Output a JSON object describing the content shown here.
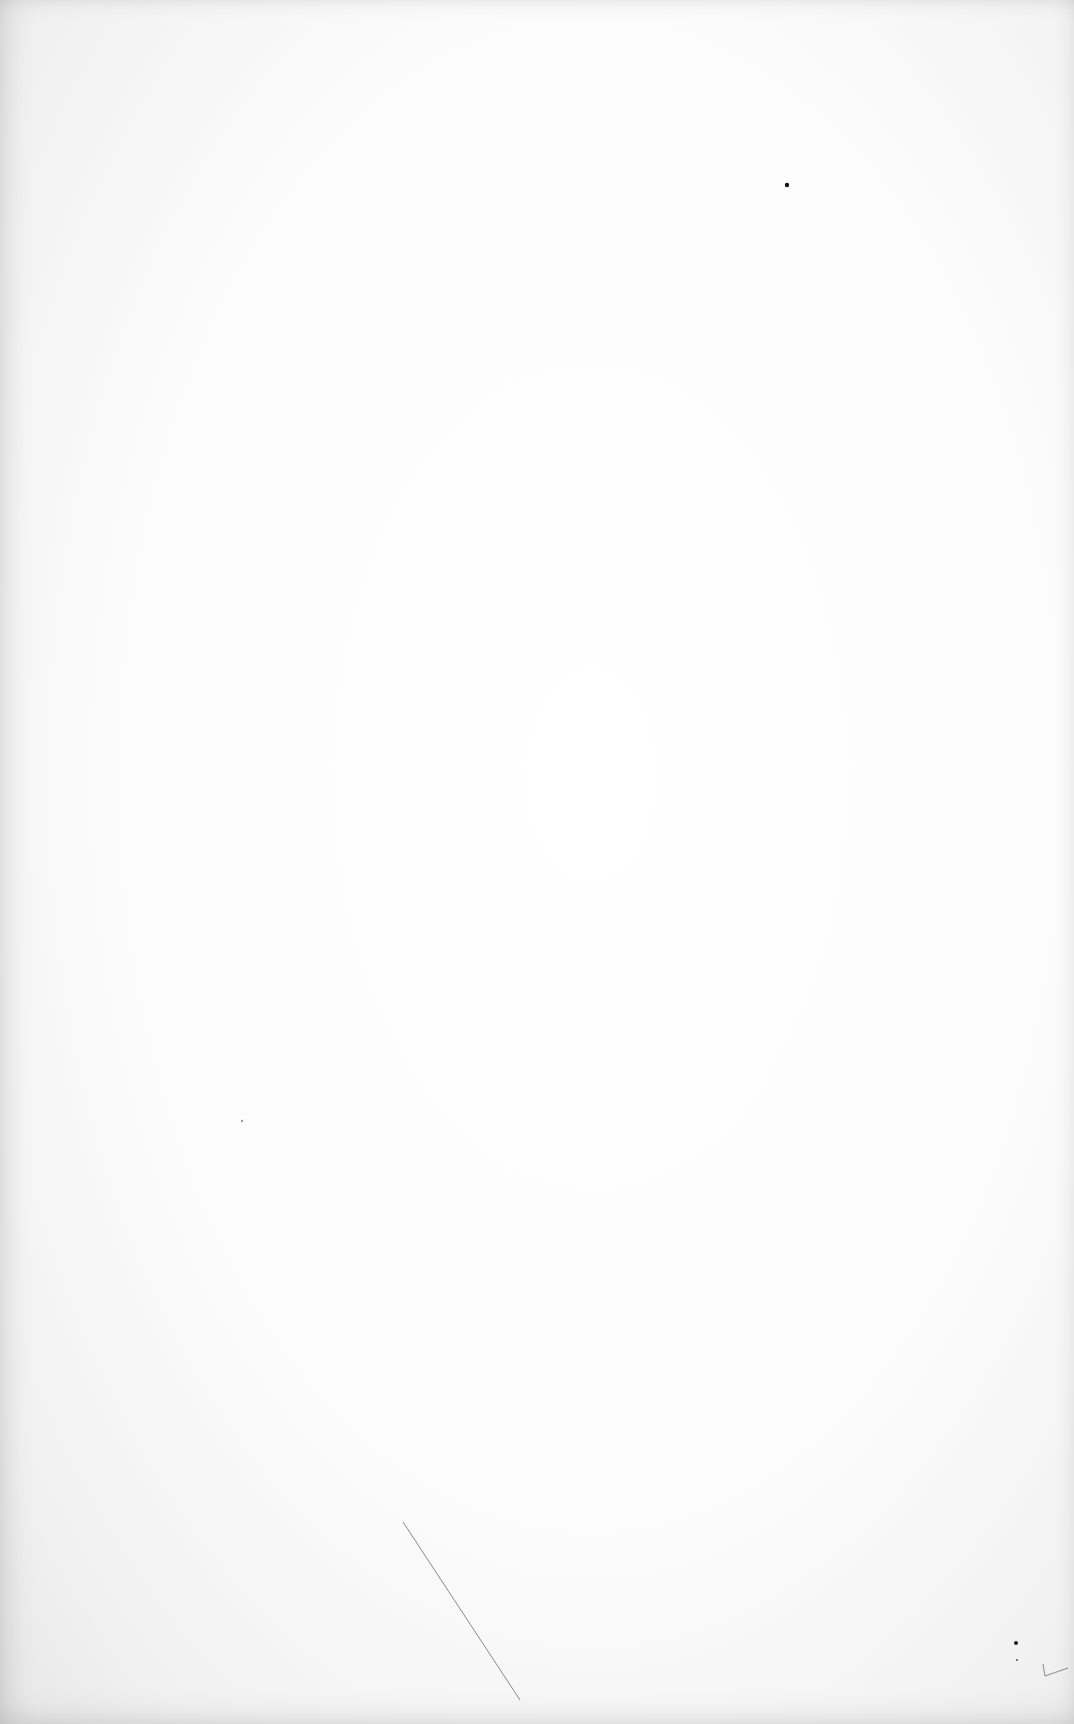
{
  "page": {
    "type": "blank scanned sheet",
    "background_color": "#fdfdfd",
    "edge_shade_color": "#e6e6e6"
  },
  "marks": [
    {
      "kind": "dot",
      "x": 787,
      "y": 185,
      "r": 2.2,
      "color": "#111111"
    },
    {
      "kind": "speck",
      "x": 242,
      "y": 1121,
      "r": 1.2,
      "color": "#9a9a9a"
    },
    {
      "kind": "stroke",
      "x1": 403,
      "y1": 1522,
      "x2": 520,
      "y2": 1700,
      "color": "#8a8a8a",
      "width": 1
    },
    {
      "kind": "dot",
      "x": 1016,
      "y": 1643,
      "r": 2,
      "color": "#222222"
    },
    {
      "kind": "speck",
      "x": 1017,
      "y": 1660,
      "r": 1,
      "color": "#555555"
    },
    {
      "kind": "hook-stroke",
      "points": [
        [
          1043,
          1664
        ],
        [
          1045,
          1676
        ],
        [
          1068,
          1668
        ]
      ],
      "color": "#8a8a8a",
      "width": 1
    }
  ]
}
